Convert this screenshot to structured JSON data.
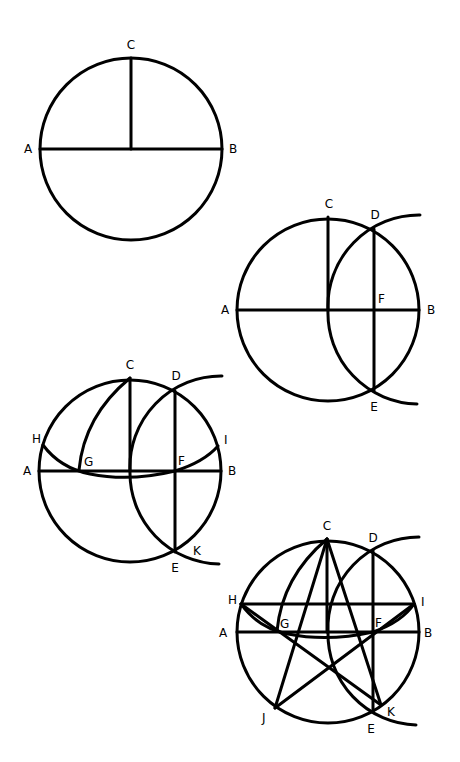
{
  "colors": {
    "stroke": "#000000",
    "background": "#ffffff"
  },
  "steps": [
    {
      "id": 1,
      "labels": {
        "A": "A",
        "B": "B",
        "C": "C"
      }
    },
    {
      "id": 2,
      "labels": {
        "A": "A",
        "B": "B",
        "C": "C",
        "D": "D",
        "E": "E",
        "F": "F"
      }
    },
    {
      "id": 3,
      "labels": {
        "A": "A",
        "B": "B",
        "C": "C",
        "D": "D",
        "E": "E",
        "F": "F",
        "G": "G",
        "H": "H",
        "I": "I",
        "K": "K"
      }
    },
    {
      "id": 4,
      "labels": {
        "A": "A",
        "B": "B",
        "C": "C",
        "D": "D",
        "E": "E",
        "F": "F",
        "G": "G",
        "H": "H",
        "I": "I",
        "J": "J",
        "K": "K"
      }
    }
  ]
}
